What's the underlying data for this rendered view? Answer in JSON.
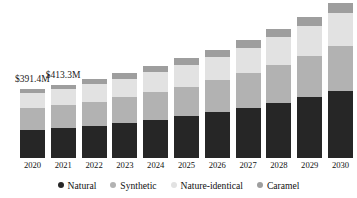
{
  "chart_data": {
    "type": "bar",
    "subtype": "stacked-bar",
    "title": "",
    "subtitle": "",
    "xlabel": "",
    "ylabel": "",
    "grid": false,
    "legend_position": "bottom",
    "ylim": [
      0,
      1000
    ],
    "categories": [
      "2020",
      "2021",
      "2022",
      "2023",
      "2024",
      "2025",
      "2026",
      "2027",
      "2028",
      "2029",
      "2030"
    ],
    "series": [
      {
        "name": "Natural",
        "color": "#262626",
        "values": [
          160,
          171,
          184,
          199,
          216,
          236,
          258,
          283,
          311,
          343,
          379
        ]
      },
      {
        "name": "Synthetic",
        "color": "#b2b2b2",
        "values": [
          121,
          128,
          136,
          146,
          157,
          169,
          183,
          198,
          215,
          234,
          255
        ]
      },
      {
        "name": "Nature-identical",
        "color": "#e2e2e2",
        "values": [
          85,
          90,
          97,
          104,
          112,
          122,
          132,
          144,
          157,
          172,
          188
        ]
      },
      {
        "name": "Caramel",
        "color": "#9e9e9e",
        "values": [
          25,
          27,
          29,
          31,
          34,
          37,
          40,
          43,
          47,
          51,
          56
        ]
      }
    ],
    "totals": [
      391.4,
      413.3,
      438.0,
      466.0,
      498.0,
      534.0,
      575.0,
      621.0,
      673.0,
      732.0,
      798.0
    ],
    "annotations": [
      {
        "category": "2020",
        "text": "$391.4M"
      },
      {
        "category": "2021",
        "text": "$413.3M"
      }
    ],
    "colors": {
      "natural": "#262626",
      "synthetic": "#b2b2b2",
      "nature_identical": "#e2e2e2",
      "caramel": "#9e9e9e",
      "background": "#ffffff",
      "text": "#111111"
    }
  },
  "legend": {
    "items": [
      {
        "label": "Natural",
        "color": "#262626"
      },
      {
        "label": "Synthetic",
        "color": "#b2b2b2"
      },
      {
        "label": "Nature-identical",
        "color": "#e2e2e2"
      },
      {
        "label": "Caramel",
        "color": "#9e9e9e"
      }
    ]
  },
  "axis": {
    "x_ticks": [
      "2020",
      "2021",
      "2022",
      "2023",
      "2024",
      "2025",
      "2026",
      "2027",
      "2028",
      "2029",
      "2030"
    ]
  }
}
